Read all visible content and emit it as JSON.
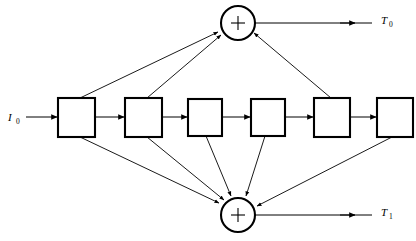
{
  "diagram": {
    "type": "signal-flow-block-diagram",
    "colors": {
      "background": "#ffffff",
      "stroke": "#000000",
      "box_fill": "#ffffff"
    },
    "input": {
      "name": "input-signal",
      "symbol": "I",
      "subscript": "0",
      "label": "I0",
      "x": 10,
      "y": 117
    },
    "delay_boxes": [
      {
        "id": "box-1",
        "index": 1,
        "x": 58,
        "y": 98,
        "w": 37,
        "h": 39
      },
      {
        "id": "box-2",
        "index": 2,
        "x": 125,
        "y": 98,
        "w": 37,
        "h": 39
      },
      {
        "id": "box-3",
        "index": 3,
        "x": 188,
        "y": 99,
        "w": 34,
        "h": 37
      },
      {
        "id": "box-4",
        "index": 4,
        "x": 251,
        "y": 99,
        "w": 34,
        "h": 37
      },
      {
        "id": "box-5",
        "index": 5,
        "x": 314,
        "y": 98,
        "w": 36,
        "h": 39
      },
      {
        "id": "box-6",
        "index": 6,
        "x": 377,
        "y": 98,
        "w": 36,
        "h": 39
      }
    ],
    "adders": [
      {
        "id": "adder-top",
        "name": "top-adder",
        "operator": "+",
        "cx": 238,
        "cy": 23,
        "r": 17,
        "output": {
          "symbol": "T",
          "subscript": "0",
          "label": "T0",
          "x": 382,
          "y": 20
        }
      },
      {
        "id": "adder-bottom",
        "name": "bottom-adder",
        "operator": "+",
        "cx": 238,
        "cy": 215,
        "r": 17,
        "output": {
          "symbol": "T",
          "subscript": "1",
          "label": "T1",
          "x": 382,
          "y": 212
        }
      }
    ],
    "connections": {
      "chain": [
        "input -> box-1",
        "box-1 -> box-2",
        "box-2 -> box-3",
        "box-3 -> box-4",
        "box-4 -> box-5",
        "box-5 -> box-6"
      ],
      "to_top_adder": [
        "box-1 top-right corner -> adder-top",
        "box-2 top-right corner -> adder-top",
        "box-5 top-left corner -> adder-top"
      ],
      "to_bottom_adder": [
        "box-1 bottom-right corner -> adder-bottom",
        "box-2 bottom-right corner -> adder-bottom",
        "box-3 bottom-center -> adder-bottom",
        "box-4 bottom-left -> adder-bottom",
        "box-6 bottom-left corner -> adder-bottom"
      ],
      "outputs": [
        "adder-top -> T0",
        "adder-bottom -> T1"
      ]
    }
  }
}
